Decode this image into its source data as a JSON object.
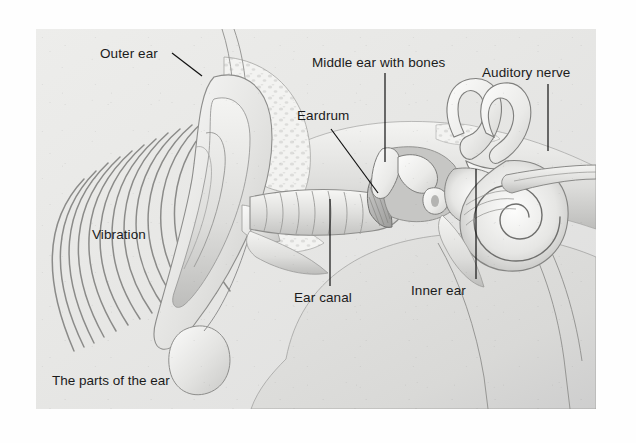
{
  "figure": {
    "caption": "The parts of the ear",
    "background_color": "#e9e9e7",
    "ink_color": "#1b1b1b",
    "page_color": "#ffffff"
  },
  "labels": [
    {
      "id": "outer-ear",
      "text": "Outer ear",
      "x": 100,
      "y": 47,
      "leader": "diagonal-down-right"
    },
    {
      "id": "middle-ear",
      "text": "Middle ear with bones",
      "x": 312,
      "y": 56,
      "leader": "vertical-down"
    },
    {
      "id": "auditory-nerve",
      "text": "Auditory nerve",
      "x": 482,
      "y": 66,
      "leader": "vertical-down"
    },
    {
      "id": "eardrum",
      "text": "Eardrum",
      "x": 297,
      "y": 109,
      "leader": "diagonal-down-right"
    },
    {
      "id": "vibration",
      "text": "Vibration",
      "x": 92,
      "y": 228,
      "leader": "none"
    },
    {
      "id": "ear-canal",
      "text": "Ear canal",
      "x": 294,
      "y": 291,
      "leader": "vertical-up"
    },
    {
      "id": "inner-ear",
      "text": "Inner ear",
      "x": 411,
      "y": 284,
      "leader": "vertical-up"
    }
  ],
  "caption_position": {
    "x": 52,
    "y": 374
  },
  "sound_waves": {
    "count": 14,
    "description": "concentric arcs opening left, representing sound vibration reaching the ear"
  },
  "anatomy_parts": [
    "pinna (outer ear)",
    "ear lobe",
    "ear canal",
    "eardrum (tympanic membrane)",
    "ossicles (middle ear bones)",
    "semicircular canals",
    "cochlea",
    "auditory nerve",
    "temporal bone"
  ]
}
